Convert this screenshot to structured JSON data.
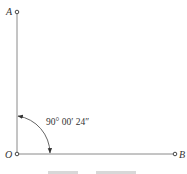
{
  "diagram": {
    "type": "angle-measurement",
    "points": {
      "A": {
        "label": "A",
        "x": 17,
        "y": 12
      },
      "O": {
        "label": "O",
        "x": 17,
        "y": 154
      },
      "B": {
        "label": "B",
        "x": 175,
        "y": 154
      }
    },
    "angle": {
      "vertex": "O",
      "from": "A",
      "to": "B",
      "label": "90° 00′ 24″"
    },
    "caption": "",
    "colors": {
      "line": "#8a8a8a",
      "text": "#333333",
      "point": "#333333"
    }
  }
}
